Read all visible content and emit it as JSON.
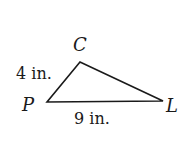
{
  "figure": {
    "type": "triangle",
    "vertices": [
      {
        "name": "C",
        "x": 80,
        "y": 62
      },
      {
        "name": "P",
        "x": 47,
        "y": 102
      },
      {
        "name": "L",
        "x": 163,
        "y": 101
      }
    ],
    "labels": {
      "C": "C",
      "P": "P",
      "L": "L",
      "side_PC": "4 in.",
      "side_PL": "9 in."
    },
    "stroke_color": "#1a1a1a"
  }
}
